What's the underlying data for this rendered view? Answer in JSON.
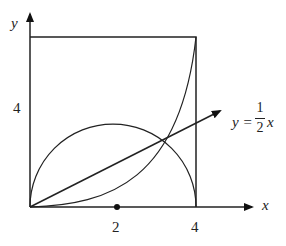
{
  "diagram": {
    "axes": {
      "x_label": "x",
      "y_label": "y"
    },
    "ticks": {
      "x": [
        "2",
        "4"
      ],
      "y": [
        "4"
      ]
    },
    "line_label": {
      "lhs": "y =",
      "numerator": "1",
      "denominator": "2",
      "var": "x"
    },
    "elements": [
      "square [0,4]x[0,4]",
      "semicircle centered at (2,0) radius 2",
      "curve from (0,0) rising to (4,4)",
      "line y = x/2 with arrow",
      "point at (2,0)"
    ],
    "colors": {
      "stroke": "#222222",
      "background": "#ffffff"
    }
  }
}
